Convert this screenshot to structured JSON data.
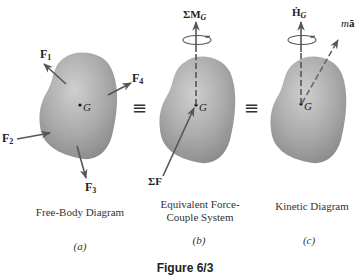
{
  "figure": {
    "caption": "Figure 6/3",
    "equivalence_symbol": "≡"
  },
  "panels": [
    {
      "id": "a",
      "title": "Free-Body Diagram",
      "part_label": "(a)",
      "center_label": "G",
      "forces": [
        {
          "symbol": "F",
          "subscript": "1"
        },
        {
          "symbol": "F",
          "subscript": "2"
        },
        {
          "symbol": "F",
          "subscript": "3"
        },
        {
          "symbol": "F",
          "subscript": "4"
        }
      ]
    },
    {
      "id": "b",
      "title_line1": "Equivalent Force-",
      "title_line2": "Couple System",
      "part_label": "(b)",
      "center_label": "G",
      "moment_label": {
        "prefix": "ΣM",
        "subscript": "G"
      },
      "force_label": "ΣF"
    },
    {
      "id": "c",
      "title": "Kinetic Diagram",
      "part_label": "(c)",
      "center_label": "G",
      "angular_momentum_label": {
        "prefix": "Ḣ",
        "subscript": "G"
      },
      "inertia_label": {
        "m": "m",
        "a": "ā"
      }
    }
  ],
  "colors": {
    "body_fill_light": "#c8c8c8",
    "body_fill_dark": "#8f8f8f",
    "vector": "#555555",
    "text": "#222222"
  }
}
